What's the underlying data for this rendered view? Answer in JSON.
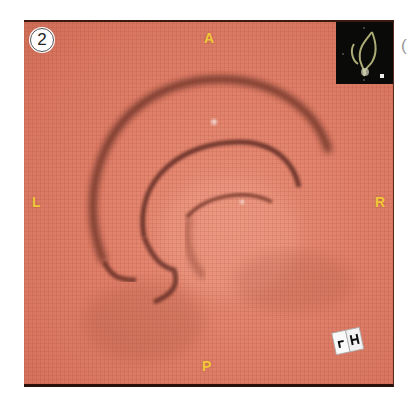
{
  "figure": {
    "panel_number": "2",
    "orientation": {
      "top": "A",
      "bottom": "P",
      "left": "L",
      "right": "R"
    },
    "orientation_color": "#f2c73a",
    "tissue_color": "#e0806a",
    "inset": {
      "description": "3D overview of colon with position marker",
      "background": "#0a0a08"
    },
    "orientation_cube": {
      "face_left": "F",
      "face_right": "H"
    },
    "adjacent_panel_mark": "("
  }
}
